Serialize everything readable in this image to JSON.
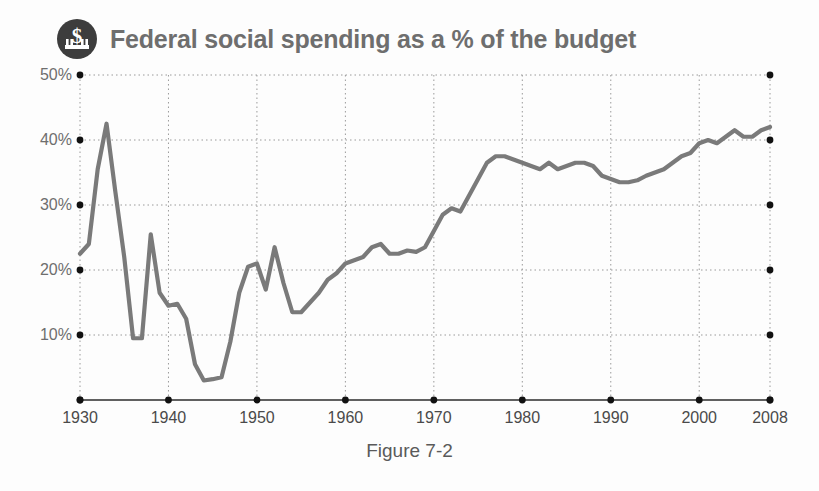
{
  "title": {
    "text": "Federal social spending as a % of the budget",
    "icon": "capitol-dollar-icon",
    "color": "#6e6e6e"
  },
  "caption": {
    "text": "Figure 7-2"
  },
  "colors": {
    "line": "#7a7a7a",
    "grid": "#9a9a9a",
    "axis": "#2b2b2b",
    "marker": "#111111",
    "text": "#6e6e6e"
  },
  "chart_data": {
    "type": "line",
    "title": "Federal social spending as a % of the budget",
    "xlabel": "",
    "ylabel": "",
    "xlim": [
      1930,
      2008
    ],
    "ylim": [
      0,
      50
    ],
    "grid": true,
    "legend": null,
    "ytick_labels": [
      "10%",
      "20%",
      "30%",
      "40%",
      "50%"
    ],
    "ytick_values": [
      10,
      20,
      30,
      40,
      50
    ],
    "xtick_labels": [
      "1930",
      "1940",
      "1950",
      "1960",
      "1970",
      "1980",
      "1990",
      "2000",
      "2008"
    ],
    "xtick_values": [
      1930,
      1940,
      1950,
      1960,
      1970,
      1980,
      1990,
      2000,
      2008
    ],
    "series": [
      {
        "name": "Federal social spending (% of budget)",
        "x": [
          1930,
          1931,
          1932,
          1933,
          1934,
          1935,
          1936,
          1937,
          1938,
          1939,
          1940,
          1941,
          1942,
          1943,
          1944,
          1945,
          1946,
          1947,
          1948,
          1949,
          1950,
          1951,
          1952,
          1953,
          1954,
          1955,
          1956,
          1957,
          1958,
          1959,
          1960,
          1961,
          1962,
          1963,
          1964,
          1965,
          1966,
          1967,
          1968,
          1969,
          1970,
          1971,
          1972,
          1973,
          1974,
          1975,
          1976,
          1977,
          1978,
          1979,
          1980,
          1981,
          1982,
          1983,
          1984,
          1985,
          1986,
          1987,
          1988,
          1989,
          1990,
          1991,
          1992,
          1993,
          1994,
          1995,
          1996,
          1997,
          1998,
          1999,
          2000,
          2001,
          2002,
          2003,
          2004,
          2005,
          2006,
          2007,
          2008
        ],
        "values": [
          22.5,
          24.0,
          35.5,
          42.5,
          32.0,
          22.0,
          9.5,
          9.5,
          25.5,
          16.5,
          14.5,
          14.8,
          12.5,
          5.5,
          3.0,
          3.2,
          3.5,
          9.0,
          16.5,
          20.5,
          21.0,
          17.0,
          23.5,
          18.0,
          13.5,
          13.5,
          15.0,
          16.5,
          18.5,
          19.5,
          21.0,
          21.5,
          22.0,
          23.5,
          24.0,
          22.5,
          22.5,
          23.0,
          22.8,
          23.5,
          26.0,
          28.5,
          29.5,
          29.0,
          31.5,
          34.0,
          36.5,
          37.5,
          37.5,
          37.0,
          36.5,
          36.0,
          35.5,
          36.5,
          35.5,
          36.0,
          36.5,
          36.5,
          36.0,
          34.5,
          34.0,
          33.5,
          33.5,
          33.8,
          34.5,
          35.0,
          35.5,
          36.5,
          37.5,
          38.0,
          39.5,
          40.0,
          39.5,
          40.5,
          41.5,
          40.5,
          40.5,
          41.5,
          42.0
        ]
      }
    ]
  }
}
